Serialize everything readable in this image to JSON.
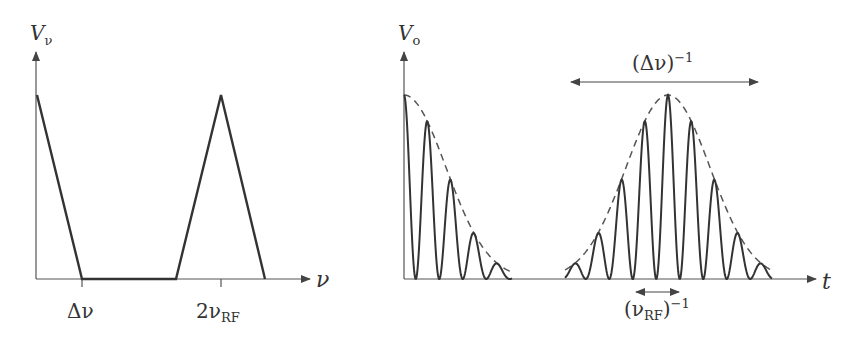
{
  "left_panel": {
    "y_axis_label": "V",
    "y_axis_label_sub": "ν",
    "x_axis_label": "ν",
    "ticks": [
      {
        "label_main": "Δν",
        "label_sub": ""
      },
      {
        "label_main": "2ν",
        "label_sub": "RF"
      }
    ]
  },
  "right_panel": {
    "y_axis_label": "V",
    "y_axis_label_sub": "o",
    "x_axis_label": "t",
    "annotations": {
      "envelope_width": {
        "main": "(Δν)",
        "sup": "−1"
      },
      "carrier_period": {
        "open": "(ν",
        "sub": "RF",
        "close": ")",
        "sup": "−1"
      }
    }
  },
  "chart_data": [
    {
      "type": "line",
      "title": "Spectrum",
      "xlabel": "ν",
      "ylabel": "V_ν",
      "x_ticks": [
        "Δν",
        "2ν_RF"
      ],
      "series": [
        {
          "name": "baseband triangle",
          "x": [
            0,
            1
          ],
          "y": [
            1,
            0
          ]
        },
        {
          "name": "flat",
          "x": [
            1,
            2
          ],
          "y": [
            0,
            0
          ]
        },
        {
          "name": "2ν_RF triangle",
          "x": [
            2,
            3,
            4
          ],
          "y": [
            0,
            1,
            0
          ]
        }
      ],
      "grid": false
    },
    {
      "type": "line",
      "title": "Time domain output",
      "xlabel": "t",
      "ylabel": "V_o",
      "series": [
        {
          "name": "oscillation (carrier at 2ν_RF)",
          "style": "solid"
        },
        {
          "name": "envelope (width ~ (Δν)^-1)",
          "style": "dashed"
        }
      ],
      "annotations": [
        "(Δν)^-1",
        "(ν_RF)^-1"
      ],
      "grid": false
    }
  ]
}
